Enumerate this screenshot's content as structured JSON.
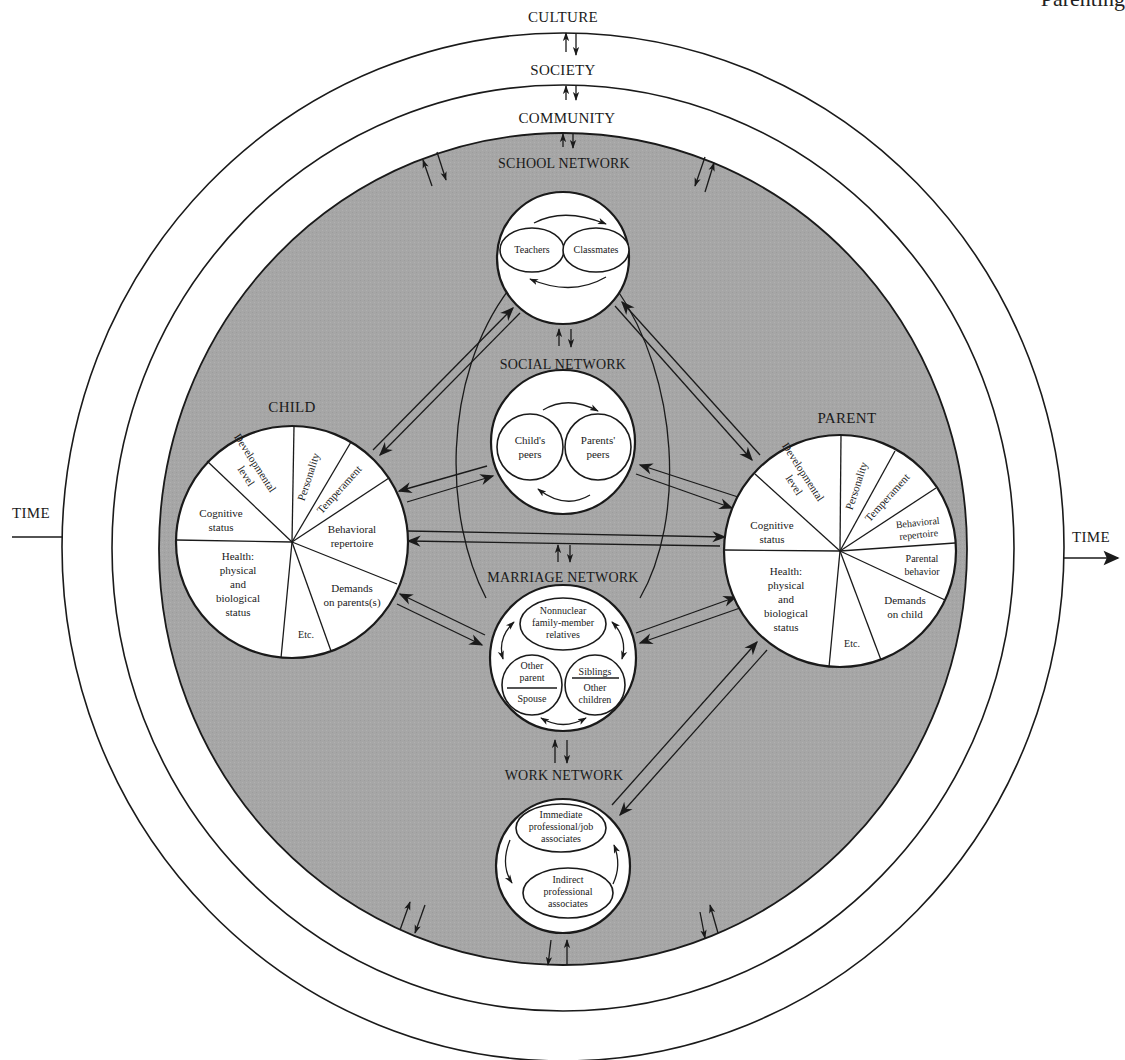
{
  "page": {
    "running_header": "Parenting"
  },
  "context_layers": {
    "outer": "CULTURE",
    "middle": "SOCIETY",
    "inner": "COMMUNITY",
    "time_left": "TIME",
    "time_right": "TIME"
  },
  "colors": {
    "community_fill": "#a6a6a6",
    "line": "#1a1a1a",
    "background": "#ffffff"
  },
  "networks": {
    "school": {
      "title": "SCHOOL NETWORK",
      "members": [
        "Teachers",
        "Classmates"
      ]
    },
    "social": {
      "title": "SOCIAL NETWORK",
      "members": [
        [
          "Child's",
          "peers"
        ],
        [
          "Parents'",
          "peers"
        ]
      ]
    },
    "marriage": {
      "title": "MARRIAGE NETWORK",
      "top": [
        "Nonnuclear",
        "family-member",
        "relatives"
      ],
      "left_top": [
        "Other",
        "parent"
      ],
      "left_bottom": "Spouse",
      "right_top": "Siblings",
      "right_bottom": [
        "Other",
        "children"
      ]
    },
    "work": {
      "title": "WORK NETWORK",
      "top": [
        "Immediate",
        "professional/job",
        "associates"
      ],
      "bottom": [
        "Indirect",
        "professional",
        "associates"
      ]
    }
  },
  "child": {
    "title": "CHILD",
    "segments": {
      "developmental": [
        "Developmental",
        "level"
      ],
      "personality": "Personality",
      "temperament": "Temperament",
      "behavioral": [
        "Behavioral",
        "repertoire"
      ],
      "demands": [
        "Demands",
        "on parents(s)"
      ],
      "etc": "Etc.",
      "health": [
        "Health:",
        "physical",
        "and",
        "biological",
        "status"
      ],
      "cognitive": [
        "Cognitive",
        "status"
      ]
    }
  },
  "parent": {
    "title": "PARENT",
    "segments": {
      "developmental": [
        "Developmental",
        "level"
      ],
      "personality": "Personality",
      "temperament": "Temperament",
      "behavioral": [
        "Behavioral",
        "repertoire"
      ],
      "parental": [
        "Parental",
        "behavior"
      ],
      "demands": [
        "Demands",
        "on child"
      ],
      "etc": "Etc.",
      "health": [
        "Health:",
        "physical",
        "and",
        "biological",
        "status"
      ],
      "cognitive": [
        "Cognitive",
        "status"
      ]
    }
  }
}
